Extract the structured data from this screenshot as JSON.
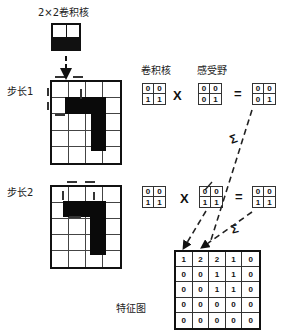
{
  "title": "2×2卷积核",
  "labels": {
    "step1": "步长1",
    "step2": "步长2",
    "kernel": "卷积核",
    "receptive_field": "感受野",
    "feature_map": "特征图"
  },
  "operators": {
    "multiply": "X",
    "equals": "=",
    "sum": "Σ"
  },
  "kernel_matrix": [
    [
      "0",
      "0"
    ],
    [
      "1",
      "1"
    ]
  ],
  "step1": {
    "receptive_field": [
      [
        "0",
        "0"
      ],
      [
        "0",
        "1"
      ]
    ],
    "result": [
      [
        "0",
        "0"
      ],
      [
        "0",
        "1"
      ]
    ]
  },
  "step2": {
    "receptive_field": [
      [
        "0",
        "0"
      ],
      [
        "1",
        "1"
      ]
    ],
    "result": [
      [
        "0",
        "0"
      ],
      [
        "1",
        "1"
      ]
    ]
  },
  "feature_map": [
    [
      "1",
      "2",
      "2",
      "1",
      "0"
    ],
    [
      "0",
      "0",
      "1",
      "1",
      "0"
    ],
    [
      "0",
      "0",
      "1",
      "1",
      "0"
    ],
    [
      "0",
      "0",
      "0",
      "0",
      "0"
    ],
    [
      "0",
      "0",
      "0",
      "0",
      "0"
    ]
  ],
  "input_grid": {
    "rows": 5,
    "cols": 4
  },
  "colors": {
    "ink": "#111111",
    "background": "#ffffff"
  }
}
